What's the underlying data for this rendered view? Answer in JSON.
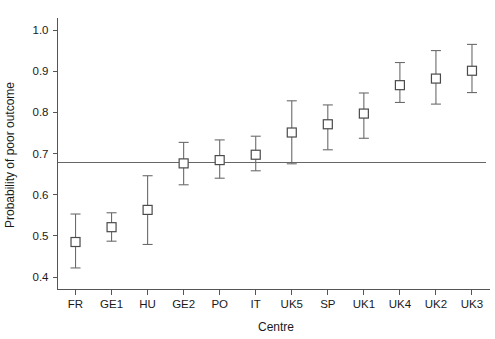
{
  "chart_data": {
    "type": "scatter",
    "title": "",
    "xlabel": "Centre",
    "ylabel": "Probability of poor outcome",
    "categories": [
      "FR",
      "GE1",
      "HU",
      "GE2",
      "PO",
      "IT",
      "UK5",
      "SP",
      "UK1",
      "UK4",
      "UK2",
      "UK3"
    ],
    "values": [
      0.485,
      0.521,
      0.563,
      0.676,
      0.684,
      0.697,
      0.751,
      0.771,
      0.797,
      0.866,
      0.882,
      0.901
    ],
    "error_low": [
      0.422,
      0.487,
      0.479,
      0.624,
      0.64,
      0.658,
      0.675,
      0.709,
      0.737,
      0.824,
      0.82,
      0.848
    ],
    "error_high": [
      0.553,
      0.556,
      0.646,
      0.727,
      0.733,
      0.742,
      0.828,
      0.818,
      0.847,
      0.921,
      0.95,
      0.965
    ],
    "reference_line": 0.678,
    "ylim": [
      0.4,
      1.03
    ],
    "ytick_values": [
      0.4,
      0.5,
      0.6,
      0.7,
      0.8,
      0.9,
      1.0
    ],
    "ytick_labels": [
      "0.4",
      "0.5",
      "0.6",
      "0.7",
      "0.8",
      "0.9",
      "1.0"
    ],
    "grid": false,
    "legend": "none",
    "marker": "open-square",
    "colors": {
      "marker_stroke": "#4a4a4a",
      "marker_fill": "#ffffff",
      "error_bar": "#6b6b6b",
      "axis": "#555555",
      "reference_line": "#666666",
      "background": "#ffffff",
      "text": "#1a1a1a"
    }
  }
}
